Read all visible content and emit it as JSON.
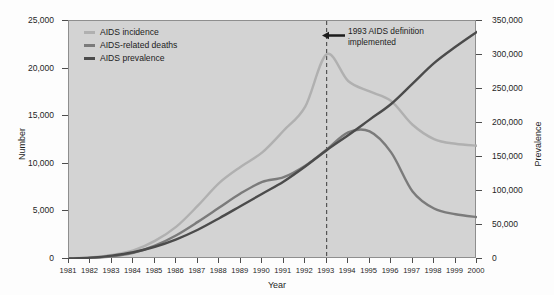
{
  "chart_data": {
    "type": "line",
    "title": "",
    "xlabel": "Year",
    "ylabel": "Number",
    "ylabel_right": "Prevalence",
    "grid": false,
    "legend_position": "top-left",
    "xlim": [
      1981,
      2000
    ],
    "ylim": [
      0,
      25000
    ],
    "ylim_right": [
      0,
      350000
    ],
    "x": [
      1981,
      1982,
      1983,
      1984,
      1985,
      1986,
      1987,
      1988,
      1989,
      1990,
      1991,
      1992,
      1993,
      1994,
      1995,
      1996,
      1997,
      1998,
      1999,
      2000
    ],
    "xticklabels": [
      "1981",
      "1982",
      "1983",
      "1984",
      "1985",
      "1986",
      "1987",
      "1988",
      "1989",
      "1990",
      "1991",
      "1992",
      "1993",
      "1994",
      "1995",
      "1996",
      "1997",
      "1998",
      "1999",
      "2000"
    ],
    "yticks": [
      0,
      5000,
      10000,
      15000,
      20000,
      25000
    ],
    "yticklabels": [
      "0",
      "5,000",
      "10,000",
      "15,000",
      "20,000",
      "25,000"
    ],
    "yticks_right": [
      0,
      50000,
      100000,
      150000,
      200000,
      250000,
      300000,
      350000
    ],
    "yticklabels_right": [
      "0",
      "50,000",
      "100,000",
      "150,000",
      "200,000",
      "250,000",
      "300,000",
      "350,000"
    ],
    "series": [
      {
        "name": "AIDS incidence",
        "color": "#b0b0b0",
        "axis": "left",
        "values": [
          60,
          160,
          420,
          900,
          1900,
          3400,
          5600,
          8000,
          9700,
          11200,
          13500,
          16000,
          21500,
          18700,
          17600,
          16600,
          14100,
          12600,
          12100,
          11900
        ]
      },
      {
        "name": "AIDS-related deaths",
        "color": "#7b7b7b",
        "axis": "left",
        "values": [
          30,
          100,
          280,
          650,
          1400,
          2500,
          3900,
          5400,
          6900,
          8100,
          8600,
          9800,
          11500,
          13300,
          13400,
          11200,
          7100,
          5300,
          4700,
          4400
        ]
      },
      {
        "name": "AIDS prevalence",
        "color": "#4b4b4b",
        "axis": "right",
        "values": [
          800,
          2000,
          5000,
          10000,
          18000,
          29000,
          43000,
          60000,
          78000,
          96000,
          114000,
          136000,
          160000,
          182000,
          205000,
          228000,
          258000,
          288000,
          312000,
          334000
        ]
      }
    ],
    "annotations": [
      {
        "name": "1993-definition-marker",
        "x": 1993,
        "line_style": "dashed",
        "text": "1993 AIDS definition implemented",
        "text_line1": "1993 AIDS definition",
        "text_line2": "implemented",
        "arrow": "left"
      }
    ],
    "plot_background": "#d3d3d3",
    "axis_color": "#4d4d4d"
  },
  "legend": {
    "items": [
      {
        "label": "AIDS incidence",
        "color": "#b0b0b0"
      },
      {
        "label": "AIDS-related deaths",
        "color": "#7b7b7b"
      },
      {
        "label": "AIDS prevalence",
        "color": "#4b4b4b"
      }
    ]
  },
  "axes": {
    "y_left_title": "Number",
    "y_right_title": "Prevalence",
    "x_title": "Year"
  }
}
